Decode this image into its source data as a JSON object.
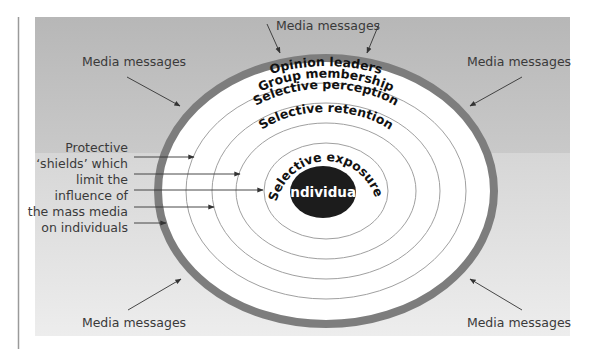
{
  "diagram": {
    "media_label": "Media messages",
    "center_label": "Individual",
    "rings": [
      {
        "label": "Opinion leaders"
      },
      {
        "label": "Group membership"
      },
      {
        "label": "Selective perception"
      },
      {
        "label": "Selective retention"
      },
      {
        "label": "Selective exposure"
      }
    ],
    "side_note_lines": [
      "Protective",
      "‘shields’ which",
      "limit the",
      "influence of",
      "the mass media",
      "on individuals"
    ],
    "media_message_labels": [
      {
        "id": "top",
        "text": "Media messages"
      },
      {
        "id": "upper-left",
        "text": "Media messages"
      },
      {
        "id": "upper-right",
        "text": "Media messages"
      },
      {
        "id": "lower-left",
        "text": "Media messages"
      },
      {
        "id": "lower-right",
        "text": "Media messages"
      }
    ],
    "colors": {
      "panel_top": "#b9b9b9",
      "panel_bottom": "#ebebeb",
      "outer_ring": "#7d7d7d",
      "ring_line": "#9a9a9a",
      "center_fill": "#1c1c1c",
      "text": "#3a3a3a"
    }
  }
}
